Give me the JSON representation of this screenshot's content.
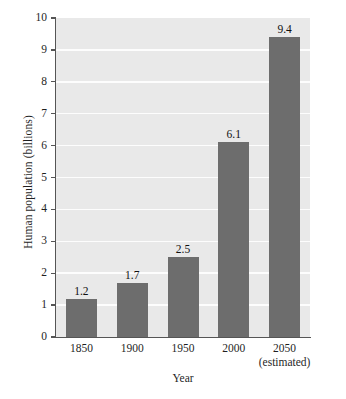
{
  "chart_data": {
    "type": "bar",
    "title": "",
    "xlabel": "Year",
    "ylabel": "Human population (billions)",
    "categories": [
      "1850",
      "1900",
      "1950",
      "2000",
      "2050"
    ],
    "category_sublabels": [
      "",
      "",
      "",
      "",
      "(estimated)"
    ],
    "values": [
      1.2,
      1.7,
      2.5,
      6.1,
      9.4
    ],
    "value_labels": [
      "1.2",
      "1.7",
      "2.5",
      "6.1",
      "9.4"
    ],
    "ylim": [
      0,
      10
    ],
    "ytick_labels": [
      "0",
      "1",
      "2",
      "3",
      "4",
      "5",
      "6",
      "7",
      "8",
      "9",
      "10"
    ],
    "ytick_values": [
      0,
      1,
      2,
      3,
      4,
      5,
      6,
      7,
      8,
      9,
      10
    ],
    "grid": true,
    "grid_axis": "y",
    "legend": "none",
    "colors": {
      "bar": "#6d6d6d",
      "plot_background": "#e9e9e9",
      "gridline": "#fdfdfd",
      "axis": "#555555",
      "text": "#1f1f1f",
      "page_background": "#ffffff"
    }
  }
}
